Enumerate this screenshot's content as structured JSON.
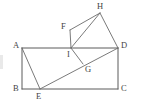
{
  "figure": {
    "type": "geometry-diagram",
    "canvas": {
      "width": 141,
      "height": 111
    },
    "colors": {
      "background": "#ffffff",
      "stroke": "#6b6b6b",
      "stroke_strong": "#5a5a5a",
      "label": "#444444"
    },
    "points": {
      "A": {
        "x": 22,
        "y": 48,
        "label": "A",
        "label_x": 13,
        "label_y": 41
      },
      "B": {
        "x": 22,
        "y": 89,
        "label": "B",
        "label_x": 13,
        "label_y": 84
      },
      "C": {
        "x": 118,
        "y": 89,
        "label": "C",
        "label_x": 121,
        "label_y": 84
      },
      "D": {
        "x": 118,
        "y": 48,
        "label": "D",
        "label_x": 121,
        "label_y": 41
      },
      "E": {
        "x": 40,
        "y": 89,
        "label": "E",
        "label_x": 36,
        "label_y": 92
      },
      "F": {
        "x": 70,
        "y": 30,
        "label": "F",
        "label_x": 61,
        "label_y": 22
      },
      "G": {
        "x": 83,
        "y": 64,
        "label": "G",
        "label_x": 85,
        "label_y": 65
      },
      "H": {
        "x": 100,
        "y": 13,
        "label": "H",
        "label_x": 97,
        "label_y": 2
      },
      "I": {
        "x": 71,
        "y": 48,
        "label": "I",
        "label_x": 67,
        "label_y": 50
      }
    },
    "segments": [
      {
        "name": "AB",
        "from": "A",
        "to": "B"
      },
      {
        "name": "BC",
        "from": "B",
        "to": "C"
      },
      {
        "name": "CD",
        "from": "C",
        "to": "D"
      },
      {
        "name": "DA",
        "from": "D",
        "to": "A"
      },
      {
        "name": "AE",
        "from": "A",
        "to": "E"
      },
      {
        "name": "ED",
        "from": "E",
        "to": "D"
      },
      {
        "name": "FH",
        "from": "F",
        "to": "H"
      },
      {
        "name": "HD",
        "from": "H",
        "to": "D"
      },
      {
        "name": "HI",
        "from": "H",
        "to": "I"
      },
      {
        "name": "FI",
        "from": "F",
        "to": "I"
      },
      {
        "name": "IG",
        "from": "I",
        "to": "G"
      }
    ]
  }
}
